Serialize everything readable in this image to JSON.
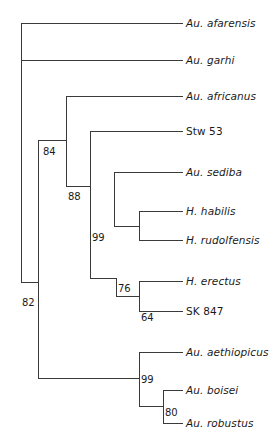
{
  "figure": {
    "type": "cladogram",
    "orientation": "left-to-right",
    "stroke_color": "#3a3a3a",
    "text_color": "#1a1a1a",
    "background": "#ffffff"
  },
  "chart_data": {
    "type": "tree",
    "title": "",
    "xlabel": "",
    "ylabel": "",
    "taxa": [
      {
        "label": "Au. afarensis",
        "italic": true,
        "tip_y": 23,
        "branch_x": 21,
        "label_x": 186
      },
      {
        "label": "Au. garhi",
        "italic": true,
        "tip_y": 60,
        "branch_x": 21,
        "label_x": 186
      },
      {
        "label": "Au. africanus",
        "italic": true,
        "tip_y": 96,
        "branch_x": 66,
        "label_x": 186
      },
      {
        "label": "Stw 53",
        "italic": false,
        "tip_y": 131,
        "branch_x": 90,
        "label_x": 186
      },
      {
        "label": "Au. sediba",
        "italic": true,
        "tip_y": 172,
        "branch_x": 114,
        "label_x": 186
      },
      {
        "label": "H. habilis",
        "italic": true,
        "tip_y": 211,
        "branch_x": 163,
        "label_x": 186
      },
      {
        "label": "H. rudolfensis",
        "italic": true,
        "tip_y": 240,
        "branch_x": 163,
        "label_x": 186
      },
      {
        "label": "H. erectus",
        "italic": true,
        "tip_y": 281,
        "branch_x": 163,
        "label_x": 186
      },
      {
        "label": "SK 847",
        "italic": false,
        "tip_y": 311,
        "branch_x": 163,
        "label_x": 186
      },
      {
        "label": "Au. aethiopicus",
        "italic": true,
        "tip_y": 352,
        "branch_x": 139,
        "label_x": 186
      },
      {
        "label": "Au. boisei",
        "italic": true,
        "tip_y": 390,
        "branch_x": 163,
        "label_x": 186
      },
      {
        "label": "Au. robustus",
        "italic": true,
        "tip_y": 423,
        "branch_x": 163,
        "label_x": 186
      }
    ],
    "support_values": [
      {
        "value": "82",
        "x": 22,
        "y": 303,
        "node_x": 38
      },
      {
        "value": "84",
        "x": 43,
        "y": 152,
        "node_x": 40
      },
      {
        "value": "88",
        "x": 68,
        "y": 197,
        "node_x": 66
      },
      {
        "value": "99",
        "x": 92,
        "y": 238,
        "node_x": 90
      },
      {
        "value": "76",
        "x": 118,
        "y": 289,
        "node_x": 116
      },
      {
        "value": "64",
        "x": 141,
        "y": 318,
        "node_x": 139
      },
      {
        "value": "99",
        "x": 141,
        "y": 380,
        "node_x": 139
      },
      {
        "value": "80",
        "x": 165,
        "y": 413,
        "node_x": 163
      }
    ],
    "edges": [
      {
        "name": "root-stem-vertical",
        "x1": 21,
        "y1": 23,
        "x2": 21,
        "y2": 60
      },
      {
        "name": "afarensis-branch",
        "x1": 21,
        "y1": 23,
        "x2": 183,
        "y2": 23
      },
      {
        "name": "garhi-branch",
        "x1": 21,
        "y1": 60,
        "x2": 183,
        "y2": 60
      },
      {
        "name": "root-to-node82",
        "x1": 21,
        "y1": 60,
        "x2": 21,
        "y2": 282
      },
      {
        "name": "node82-horizontal",
        "x1": 21,
        "y1": 282,
        "x2": 38,
        "y2": 282
      },
      {
        "name": "node82-vertical",
        "x1": 38,
        "y1": 140,
        "x2": 38,
        "y2": 378
      },
      {
        "name": "node84-to-node88",
        "x1": 38,
        "y1": 140,
        "x2": 66,
        "y2": 140
      },
      {
        "name": "node88-vertical",
        "x1": 66,
        "y1": 96,
        "x2": 66,
        "y2": 186
      },
      {
        "name": "africanus-branch",
        "x1": 66,
        "y1": 96,
        "x2": 183,
        "y2": 96
      },
      {
        "name": "node88-to-node99",
        "x1": 66,
        "y1": 186,
        "x2": 90,
        "y2": 186
      },
      {
        "name": "node99homo-vertical",
        "x1": 90,
        "y1": 131,
        "x2": 90,
        "y2": 278
      },
      {
        "name": "stw53-branch",
        "x1": 90,
        "y1": 131,
        "x2": 183,
        "y2": 131
      },
      {
        "name": "node99-to-node76",
        "x1": 90,
        "y1": 278,
        "x2": 116,
        "y2": 278
      },
      {
        "name": "node76-vertical",
        "x1": 114,
        "y1": 172,
        "x2": 114,
        "y2": 226
      },
      {
        "name": "sediba-branch",
        "x1": 114,
        "y1": 172,
        "x2": 183,
        "y2": 172
      },
      {
        "name": "habilis-clade-stem",
        "x1": 114,
        "y1": 226,
        "x2": 139,
        "y2": 226
      },
      {
        "name": "node76-lower-vertical",
        "x1": 116,
        "y1": 278,
        "x2": 116,
        "y2": 296
      },
      {
        "name": "node64-stem",
        "x1": 116,
        "y1": 296,
        "x2": 139,
        "y2": 296
      },
      {
        "name": "homo12-vertical",
        "x1": 139,
        "y1": 211,
        "x2": 139,
        "y2": 240
      },
      {
        "name": "habilis-branch",
        "x1": 139,
        "y1": 211,
        "x2": 183,
        "y2": 211
      },
      {
        "name": "rudolfensis-branch",
        "x1": 139,
        "y1": 240,
        "x2": 183,
        "y2": 240
      },
      {
        "name": "node64-vertical",
        "x1": 139,
        "y1": 281,
        "x2": 139,
        "y2": 311
      },
      {
        "name": "erectus-branch",
        "x1": 139,
        "y1": 281,
        "x2": 183,
        "y2": 281
      },
      {
        "name": "sk847-branch",
        "x1": 139,
        "y1": 311,
        "x2": 183,
        "y2": 311
      },
      {
        "name": "node82-to-robust",
        "x1": 38,
        "y1": 378,
        "x2": 139,
        "y2": 378
      },
      {
        "name": "robust99-vertical",
        "x1": 139,
        "y1": 352,
        "x2": 139,
        "y2": 406
      },
      {
        "name": "aethiopicus-branch",
        "x1": 139,
        "y1": 352,
        "x2": 183,
        "y2": 352
      },
      {
        "name": "node80-stem",
        "x1": 139,
        "y1": 406,
        "x2": 163,
        "y2": 406
      },
      {
        "name": "node80-vertical",
        "x1": 163,
        "y1": 390,
        "x2": 163,
        "y2": 423
      },
      {
        "name": "boisei-branch",
        "x1": 163,
        "y1": 390,
        "x2": 183,
        "y2": 390
      },
      {
        "name": "robustus-branch",
        "x1": 163,
        "y1": 423,
        "x2": 183,
        "y2": 423
      },
      {
        "name": "habilis-stem-vertical",
        "x1": 139,
        "y1": 226,
        "x2": 139,
        "y2": 226
      }
    ]
  }
}
